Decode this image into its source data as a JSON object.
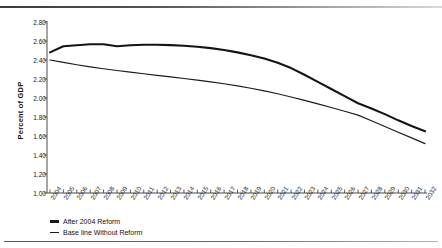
{
  "chart_data": {
    "type": "line",
    "title": "",
    "xlabel": "",
    "ylabel": "Percent of GDP",
    "ylim": [
      1.0,
      2.8
    ],
    "ytick_labels": [
      "2.80",
      "2.60",
      "2.40",
      "2.20",
      "2.00",
      "1.80",
      "1.60",
      "1.40",
      "1.20",
      "1.00"
    ],
    "ytick_values": [
      2.8,
      2.6,
      2.4,
      2.2,
      2.0,
      1.8,
      1.6,
      1.4,
      1.2,
      1.0
    ],
    "grid": false,
    "legend_position": "bottom-left",
    "x": [
      2004,
      2005,
      2006,
      2007,
      2008,
      2009,
      2010,
      2011,
      2012,
      2013,
      2014,
      2015,
      2016,
      2017,
      2018,
      2019,
      2020,
      2021,
      2022,
      2023,
      2024,
      2025,
      2026,
      2027,
      2028,
      2029,
      2030,
      2031,
      2032
    ],
    "categories": [
      "2004",
      "2005",
      "2006",
      "2007",
      "2008",
      "2009",
      "2010",
      "2011",
      "2012",
      "2013",
      "2014",
      "2015",
      "2016",
      "2017",
      "2018",
      "2019",
      "2020",
      "2021",
      "2022",
      "2023",
      "2024",
      "2025",
      "2026",
      "2027",
      "2028",
      "2029",
      "2030",
      "2031",
      "2032"
    ],
    "series": [
      {
        "name": "After 2004 Reform",
        "style": "thick",
        "color": "#141418",
        "values": [
          2.48,
          2.545,
          2.555,
          2.565,
          2.565,
          2.545,
          2.555,
          2.56,
          2.56,
          2.557,
          2.55,
          2.54,
          2.525,
          2.505,
          2.48,
          2.45,
          2.415,
          2.37,
          2.315,
          2.245,
          2.17,
          2.095,
          2.02,
          1.945,
          1.89,
          1.83,
          1.765,
          1.705,
          1.65
        ]
      },
      {
        "name": "Base line Without Reform",
        "style": "thin",
        "color": "#1b1b1f",
        "values": [
          2.4,
          2.375,
          2.35,
          2.328,
          2.308,
          2.29,
          2.272,
          2.255,
          2.238,
          2.222,
          2.205,
          2.188,
          2.17,
          2.15,
          2.128,
          2.103,
          2.075,
          2.045,
          2.01,
          1.975,
          1.938,
          1.9,
          1.86,
          1.82,
          1.76,
          1.7,
          1.64,
          1.58,
          1.52
        ]
      }
    ]
  },
  "legend": {
    "items": [
      {
        "label": "After 2004 Reform",
        "style": "thick"
      },
      {
        "label": "Base line Without Reform",
        "style": "thin"
      }
    ]
  }
}
